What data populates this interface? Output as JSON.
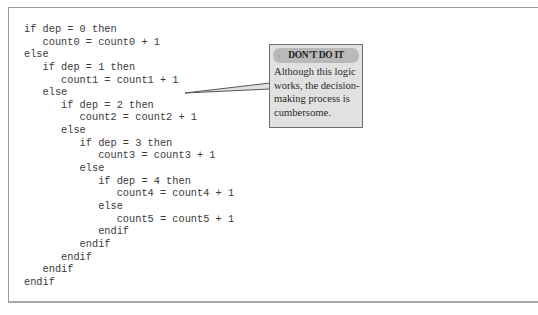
{
  "code_listing": {
    "lines": [
      "if dep = 0 then",
      "   count0 = count0 + 1",
      "else",
      "   if dep = 1 then",
      "      count1 = count1 + 1",
      "   else",
      "      if dep = 2 then",
      "         count2 = count2 + 1",
      "      else",
      "         if dep = 3 then",
      "            count3 = count3 + 1",
      "         else",
      "            if dep = 4 then",
      "               count4 = count4 + 1",
      "            else",
      "               count5 = count5 + 1",
      "            endif",
      "         endif",
      "      endif",
      "   endif",
      "endif"
    ]
  },
  "callout": {
    "header_icon": "double-chevron-right-icon",
    "header_icon_glyph": "»",
    "title": "DON'T DO IT",
    "body": "Although this logic works, the decision-making process is cumbersome.",
    "colors": {
      "box_fill": "#e1e1e1",
      "header_fill": "#b9b9b9",
      "border": "#6e6e6e"
    }
  }
}
